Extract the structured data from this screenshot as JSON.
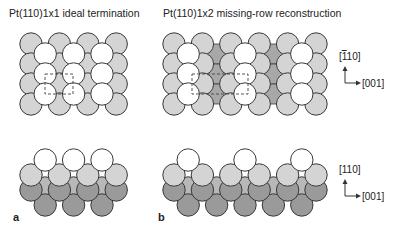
{
  "panels": [
    {
      "id": "a",
      "label": "a",
      "title": "Pt(110)1x1 ideal termination",
      "top_view": {
        "columns": 4,
        "rows": 4,
        "missing_rows": []
      },
      "side_view": {
        "surface_atoms": 3
      }
    },
    {
      "id": "b",
      "label": "b",
      "title": "Pt(110)1x2 missing-row reconstruction",
      "top_view": {
        "columns": 6,
        "rows": 4,
        "missing_rows": [
          1,
          3
        ]
      },
      "side_view": {
        "surface_atoms": 3
      }
    }
  ],
  "axes": {
    "top": {
      "vertical": "[̅110]",
      "vertical_display": "[110]",
      "vertical_bar_over_first": true,
      "horizontal": "[001]"
    },
    "side": {
      "vertical": "[110]",
      "horizontal": "[001]"
    }
  },
  "colors": {
    "top_layer": "#ffffff",
    "second_layer": "#d4d4d4",
    "third_layer": "#a8a8a8",
    "deep_layer": "#9a9a9a",
    "outline": "#3a3a3a"
  }
}
